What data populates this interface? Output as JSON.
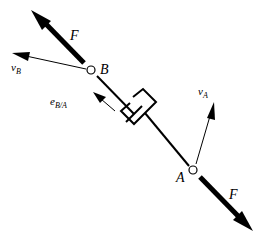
{
  "diagram": {
    "type": "free-body diagram of a two-force damper member",
    "colors": {
      "stroke": "#000000",
      "background": "#ffffff"
    },
    "points": {
      "B": {
        "label": "B"
      },
      "A": {
        "label": "A"
      }
    },
    "forces": {
      "top": {
        "label": "F"
      },
      "bottom": {
        "label": "F"
      }
    },
    "velocities": {
      "vB": {
        "symbol": "v",
        "subscript": "B"
      },
      "vA": {
        "symbol": "v",
        "subscript": "A"
      }
    },
    "unit_vector": {
      "symbol": "e",
      "subscript": "B/A"
    },
    "element": "damper (dashpot) between B and A"
  }
}
